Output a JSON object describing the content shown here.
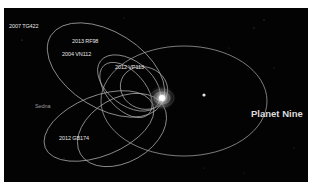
{
  "diagram": {
    "title": "Planet Nine",
    "objects": [
      {
        "name": "2007 TG422"
      },
      {
        "name": "2013 RF98"
      },
      {
        "name": "2004 VN112"
      },
      {
        "name": "2012 VP113"
      },
      {
        "name": "Sedna"
      },
      {
        "name": "2012 GB174"
      }
    ],
    "planet_label": "Planet Nine",
    "colors": {
      "background": "#030303",
      "orbit": "#b8b8b8",
      "label": "#e6e6e6",
      "border": "#ffffff"
    }
  }
}
